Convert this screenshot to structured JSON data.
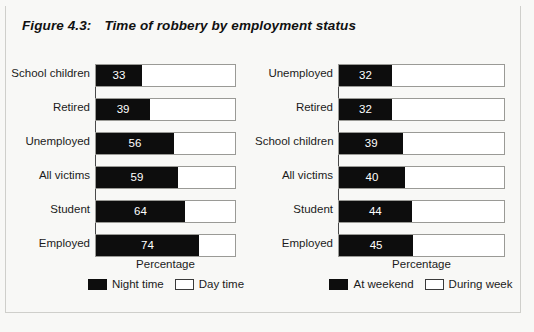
{
  "figure": {
    "number": "Figure 4.3:",
    "title": "Time of robbery by employment status"
  },
  "colors": {
    "dark_series": "#0d0d0d",
    "light_series": "#ffffff",
    "background": "#f8f8f6",
    "axis": "#4a4a4a",
    "track_border": "#9a9a96"
  },
  "chart_data": [
    {
      "type": "bar",
      "orientation": "horizontal",
      "stacked": true,
      "title": "Time of robbery by employment status",
      "panel": "left",
      "xlabel": "Percentage",
      "ylabel": "",
      "xlim": [
        0,
        100
      ],
      "grid": false,
      "legend_position": "bottom",
      "categories": [
        "School children",
        "Retired",
        "Unemployed",
        "All victims",
        "Student",
        "Employed"
      ],
      "series": [
        {
          "name": "Night time",
          "swatch": "dark",
          "values": [
            33,
            39,
            56,
            59,
            64,
            74
          ]
        },
        {
          "name": "Day time",
          "swatch": "light",
          "values": [
            67,
            61,
            44,
            41,
            36,
            26
          ]
        }
      ]
    },
    {
      "type": "bar",
      "orientation": "horizontal",
      "stacked": true,
      "title": "Time of robbery by employment status",
      "panel": "right",
      "xlabel": "Percentage",
      "ylabel": "",
      "xlim": [
        0,
        100
      ],
      "grid": false,
      "legend_position": "bottom",
      "categories": [
        "Unemployed",
        "Retired",
        "School children",
        "All victims",
        "Student",
        "Employed"
      ],
      "series": [
        {
          "name": "At weekend",
          "swatch": "dark",
          "values": [
            32,
            32,
            39,
            40,
            44,
            45
          ]
        },
        {
          "name": "During week",
          "swatch": "light",
          "values": [
            68,
            68,
            61,
            60,
            56,
            55
          ]
        }
      ]
    }
  ],
  "left_chart": {
    "axis_title": "Percentage",
    "rows": [
      {
        "label": "School children",
        "value": 33,
        "value_text": "33"
      },
      {
        "label": "Retired",
        "value": 39,
        "value_text": "39"
      },
      {
        "label": "Unemployed",
        "value": 56,
        "value_text": "56"
      },
      {
        "label": "All victims",
        "value": 59,
        "value_text": "59"
      },
      {
        "label": "Student",
        "value": 64,
        "value_text": "64"
      },
      {
        "label": "Employed",
        "value": 74,
        "value_text": "74"
      }
    ],
    "legend": [
      {
        "label": "Night time",
        "swatch": "dark"
      },
      {
        "label": "Day time",
        "swatch": "light"
      }
    ]
  },
  "right_chart": {
    "axis_title": "Percentage",
    "rows": [
      {
        "label": "Unemployed",
        "value": 32,
        "value_text": "32"
      },
      {
        "label": "Retired",
        "value": 32,
        "value_text": "32"
      },
      {
        "label": "School children",
        "value": 39,
        "value_text": "39"
      },
      {
        "label": "All victims",
        "value": 40,
        "value_text": "40"
      },
      {
        "label": "Student",
        "value": 44,
        "value_text": "44"
      },
      {
        "label": "Employed",
        "value": 45,
        "value_text": "45"
      }
    ],
    "legend": [
      {
        "label": "At weekend",
        "swatch": "dark"
      },
      {
        "label": "During week",
        "swatch": "light"
      }
    ]
  }
}
